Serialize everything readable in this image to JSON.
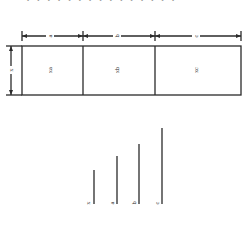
{
  "header": {
    "truncated_text": "• • • • • • • • • • • • • • •"
  },
  "diagram": {
    "top_dimensions": [
      {
        "label": "a"
      },
      {
        "label": "b"
      },
      {
        "label": "c"
      }
    ],
    "side_dimension": {
      "label": "x"
    },
    "areas": [
      {
        "label": "xa"
      },
      {
        "label": "xb"
      },
      {
        "label": "xc"
      }
    ],
    "segments": [
      {
        "label": "x"
      },
      {
        "label": "a"
      },
      {
        "label": "b"
      },
      {
        "label": "c"
      }
    ]
  },
  "colors": {
    "line": "#2a2a2a",
    "background": "#ffffff"
  }
}
